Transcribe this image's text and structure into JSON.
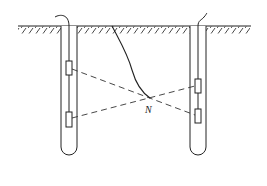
{
  "diagram": {
    "type": "cross-hole measurement schematic",
    "labels": {
      "intersection_point": "N"
    },
    "elements": {
      "ground_surface": "hatched ground line",
      "boreholes": [
        {
          "id": "left-borehole",
          "sensors": 2
        },
        {
          "id": "right-borehole",
          "sensors": 2
        }
      ],
      "ray_paths": 2,
      "fracture_curve": "curve from surface to point N"
    },
    "colors": {
      "line": "#222222",
      "background": "#ffffff"
    }
  }
}
